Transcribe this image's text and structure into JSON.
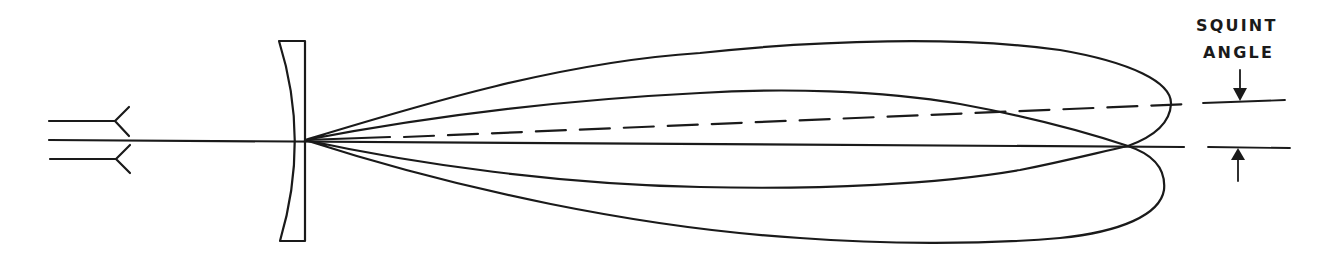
{
  "diagram": {
    "colors": {
      "ink": "#1a1a1a",
      "background": "#ffffff"
    },
    "labels": {
      "squint": "SQUINT",
      "angle": "ANGLE"
    },
    "elements": {
      "feed_horn_upper": {
        "name": "feed-horn-upper",
        "path": "M49 121 L115 121 M129 107 L115 121 L129 136"
      },
      "feed_horn_lower": {
        "name": "feed-horn-lower",
        "path": "M50 159 L116 159 M130 145 L116 159 L130 173"
      },
      "boresight_axis": {
        "name": "boresight-axis",
        "path": "M49 140 L1184 147"
      },
      "reflector": {
        "name": "reflector",
        "path": "M279 41 L305 41 L305 241 L280 241 Q310 140 279 41 Z"
      },
      "upper_lobe": {
        "name": "squinted-beam-lobe",
        "path": "M305 140 C 420 105, 560 62, 700 53 C 820 40, 960 36, 1060 50 C 1130 62, 1172 82, 1171 104 C 1170 125, 1150 138, 1128 146 C 1080 130, 1020 115, 960 104 C 880 90, 780 88, 700 93 C 560 100, 420 118, 305 140 Z"
      },
      "lower_lobe": {
        "name": "reference-beam-lobe",
        "path": "M305 140 C 420 165, 560 184, 700 187 C 820 190, 940 184, 1020 170 C 1070 160, 1100 152, 1128 146 C 1155 155, 1166 170, 1164 190 C 1160 215, 1120 232, 1060 238 C 980 245, 880 244, 800 238 C 640 228, 460 190, 305 140 Z"
      },
      "squint_axis": {
        "name": "squint-axis-dashed",
        "path_solid": "M305 140 L390 137",
        "path_dashed": "M404 137 L1188 104"
      },
      "marker_top_line": {
        "name": "squint-marker-top-line",
        "path": "M1203 103 L1285 100"
      },
      "marker_bottom_line": {
        "name": "squint-marker-bottom-line",
        "path": "M1208 147 L1290 148"
      },
      "arrow_down": {
        "name": "squint-arrow-down",
        "shaft": "M1240 70 L1240 90",
        "head": "M1233 88 L1247 88 L1240 101 Z"
      },
      "arrow_up": {
        "name": "squint-arrow-up",
        "shaft": "M1238 158 L1238 181",
        "head": "M1231 160 L1245 160 L1238 148 Z"
      }
    }
  }
}
